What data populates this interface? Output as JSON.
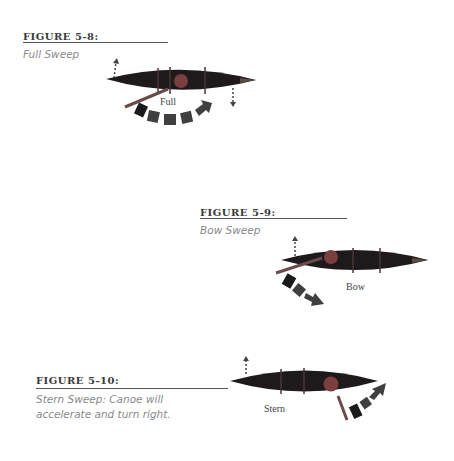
{
  "figures": [
    {
      "id": "FIGURE 5-8:",
      "caption": "Full Sweep",
      "label": "Full"
    },
    {
      "id": "FIGURE 5-9:",
      "caption": "Bow Sweep",
      "label": "Bow"
    },
    {
      "id": "FIGURE 5-10:",
      "caption_line1": "Stern Sweep: Canoe will",
      "caption_line2": "accelerate and turn right.",
      "label": "Stern"
    }
  ],
  "colors": {
    "canoe": "#1e1a1b",
    "canoe_stripe": "#4a3434",
    "paddler": "#7a3f3f",
    "arrow": "#3f3f3f",
    "arrow_start": "#1a1a1a",
    "paddle": "#6a4a4a"
  }
}
